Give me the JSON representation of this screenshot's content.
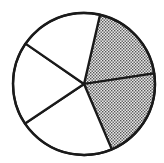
{
  "chart_data": {
    "type": "pie",
    "title": "",
    "start_angle_deg": 13,
    "direction": "clockwise",
    "center": [
      84,
      84
    ],
    "radius": 71,
    "slices": [
      {
        "label": "",
        "value": 19,
        "shaded": true
      },
      {
        "label": "",
        "value": 21,
        "shaded": true
      },
      {
        "label": "",
        "value": 22,
        "shaded": false
      },
      {
        "label": "",
        "value": 19,
        "shaded": false
      },
      {
        "label": "",
        "value": 19,
        "shaded": false
      }
    ],
    "legend": [],
    "colors": {
      "stroke": "#1a1a1a",
      "fill": "#ffffff",
      "shade_dot": "#555555",
      "shade_bg": "#e8e8e8"
    }
  }
}
